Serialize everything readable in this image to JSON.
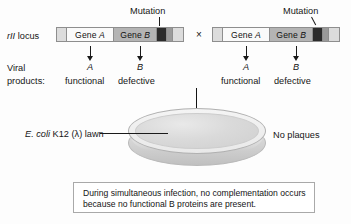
{
  "figure": {
    "locus_label_italic": "rII",
    "locus_label_rest": " locus",
    "viral_products_line1": "Viral",
    "viral_products_line2": "products:",
    "cross_symbol": "×",
    "mutation_label_left": "Mutation",
    "mutation_label_right": "Mutation",
    "no_plaques_label": "No plaques",
    "lawn_label_italic": "E. coli",
    "lawn_label_rest": " K12 (λ) lawn",
    "caption": "During simultaneous infection, no complementation occurs because no functional B proteins are present."
  },
  "left_genome": {
    "gene_a_prefix": "Gene ",
    "gene_a_italic": "A",
    "gene_b_prefix": "Gene ",
    "gene_b_italic": "B",
    "product_a_symbol": "A",
    "product_a_status": "functional",
    "product_b_symbol": "B",
    "product_b_status": "defective"
  },
  "right_genome": {
    "gene_a_prefix": "Gene ",
    "gene_a_italic": "A",
    "gene_b_prefix": "Gene ",
    "gene_b_italic": "B",
    "product_a_symbol": "A",
    "product_a_status": "functional",
    "product_b_symbol": "B",
    "product_b_status": "defective"
  },
  "colors": {
    "gene_a_fill": "#fafafa",
    "gene_b_fill": "#b4b4b4",
    "mutation_fill": "#2b2b2b",
    "flank_fill": "#dcdcdc",
    "outline": "#8e8e8e",
    "text": "#161616"
  }
}
